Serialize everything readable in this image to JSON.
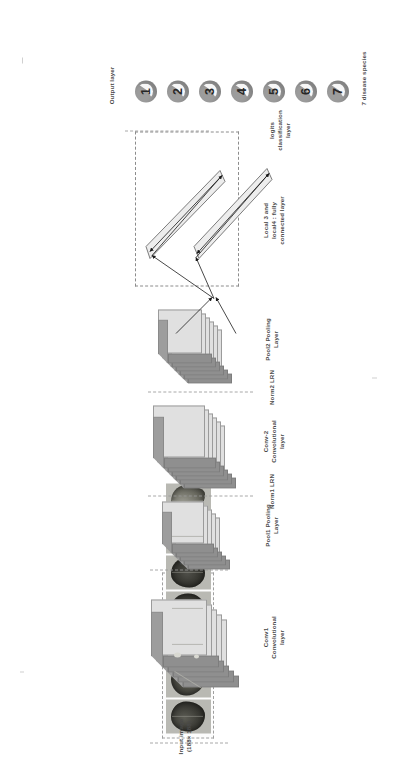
{
  "figure": {
    "orientation": "rotated-90-ccw"
  },
  "input_section": {
    "label": "Input image\n(188× 188)",
    "caption": "Image of 7 tea\nleaf diseases",
    "image_count": 7,
    "images": [
      {
        "name": "tea-leaf-1"
      },
      {
        "name": "tea-leaf-2"
      },
      {
        "name": "tea-leaf-3"
      },
      {
        "name": "tea-leaf-4"
      },
      {
        "name": "tea-leaf-5"
      },
      {
        "name": "tea-leaf-6"
      },
      {
        "name": "tea-leaf-7"
      }
    ]
  },
  "layers": [
    {
      "id": "conv1",
      "label": "Conv1\nConvolutional\nlayer",
      "slabs": 5
    },
    {
      "id": "pool1",
      "label": "Pool1 Pooling\nLayer",
      "slabs": 5
    },
    {
      "id": "conv2",
      "label": "Conv-2\nConvolutional\nlayer",
      "slabs": 6
    },
    {
      "id": "pool2",
      "label": "Pool2 Pooling\nLayer",
      "slabs": 6
    }
  ],
  "dividers": [
    {
      "id": "norm1",
      "label": "Norm1 LRN"
    },
    {
      "id": "norm2",
      "label": "Norm2 LRN"
    },
    {
      "id": "logits",
      "label": "logits\nclassification\nlayer"
    }
  ],
  "fully_connected": {
    "label": "Local 3 and\nlocal4 : fully\nconnected layer",
    "bar_count": 2
  },
  "output_section": {
    "label": "Output layer",
    "caption": "7 disease species",
    "nodes": [
      {
        "value": "1"
      },
      {
        "value": "2"
      },
      {
        "value": "3"
      },
      {
        "value": "4"
      },
      {
        "value": "5"
      },
      {
        "value": "6"
      },
      {
        "value": "7"
      }
    ]
  },
  "colors": {
    "slab_front": "#e0e0e0",
    "slab_top": "#9d9d9d",
    "slab_side": "#8f8f8f",
    "node_fill": "#9c9c9c",
    "text": "#4a4a4a",
    "dashed": "#8d8d8d"
  }
}
